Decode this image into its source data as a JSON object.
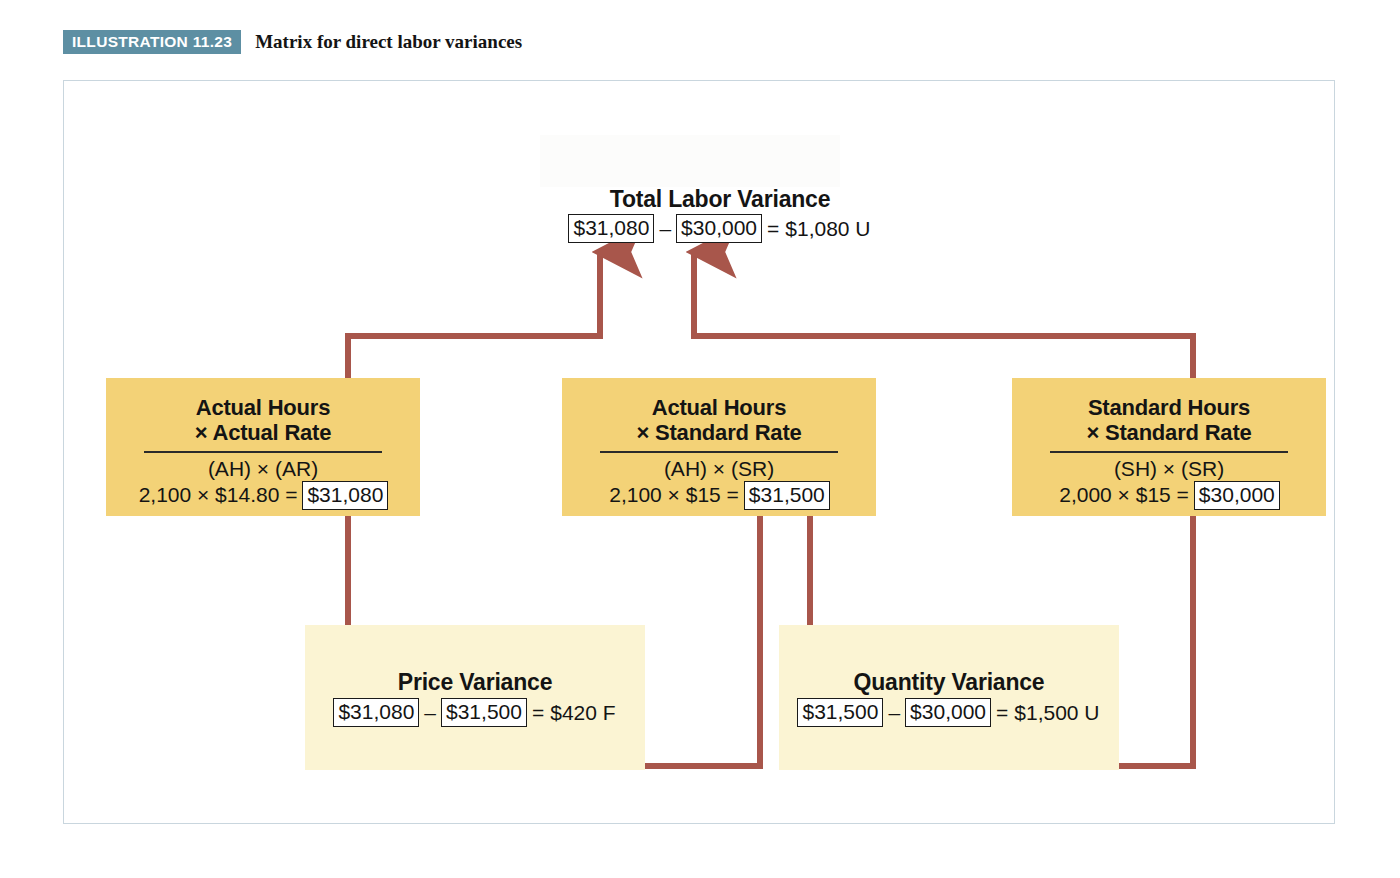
{
  "caption": {
    "badge": "ILLUSTRATION 11.23",
    "title": "Matrix for direct labor variances",
    "badge_color": "#5d8fa3"
  },
  "colors": {
    "gold_box": "#f3d277",
    "pale_box": "#fbf4d3",
    "connector": "#a8564b",
    "frame_border": "#c9d6de",
    "value_box_border": "#1a1a1a"
  },
  "diagram": {
    "total": {
      "title": "Total Labor Variance",
      "left_value": "$31,080",
      "operator": "–",
      "right_value": "$30,000",
      "equals": "=",
      "result": "$1,080 U"
    },
    "columns": [
      {
        "id": "actual-hours-actual-rate",
        "title_line1": "Actual Hours",
        "title_line2": "× Actual Rate",
        "abbrev": "(AH) × (AR)",
        "calc_prefix": "2,100 × $14.80 =",
        "calc_value": "$31,080"
      },
      {
        "id": "actual-hours-standard-rate",
        "title_line1": "Actual Hours",
        "title_line2": "× Standard Rate",
        "abbrev": "(AH) × (SR)",
        "calc_prefix": "2,100 × $15 =",
        "calc_value": "$31,500"
      },
      {
        "id": "standard-hours-standard-rate",
        "title_line1": "Standard Hours",
        "title_line2": "× Standard Rate",
        "abbrev": "(SH) × (SR)",
        "calc_prefix": "2,000 × $15 =",
        "calc_value": "$30,000"
      }
    ],
    "variances": [
      {
        "id": "price-variance",
        "title": "Price Variance",
        "left_value": "$31,080",
        "operator": "–",
        "right_value": "$31,500",
        "equals": "=",
        "result": "$420 F"
      },
      {
        "id": "quantity-variance",
        "title": "Quantity Variance",
        "left_value": "$31,500",
        "operator": "–",
        "right_value": "$30,000",
        "equals": "=",
        "result": "$1,500 U"
      }
    ]
  }
}
